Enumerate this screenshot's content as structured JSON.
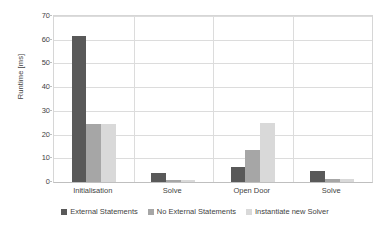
{
  "chart_data": {
    "type": "bar",
    "title": "",
    "subtitle": "",
    "xlabel": "",
    "ylabel": "Runtime [ms]",
    "categories": [
      "Initialisation",
      "Solve",
      "Open Door",
      "Solve"
    ],
    "series": [
      {
        "name": "External Statements",
        "color": "#595959",
        "values": [
          61.5,
          3.9,
          6.3,
          4.8
        ]
      },
      {
        "name": "No External Statements",
        "color": "#a6a6a6",
        "values": [
          24.3,
          0.9,
          13.3,
          1.4
        ]
      },
      {
        "name": "Instantiate new Solver",
        "color": "#d9d9d9",
        "values": [
          24.3,
          1.0,
          24.7,
          1.4
        ]
      }
    ],
    "ylim": [
      0,
      70
    ],
    "yticks": [
      0,
      10,
      20,
      30,
      40,
      50,
      60,
      70
    ],
    "ytick_labels": [
      "0",
      "10",
      "20",
      "30",
      "40",
      "50",
      "60",
      "70"
    ],
    "grid": "horizontal-and-category-separators",
    "legend_position": "bottom",
    "gridline_color": "#dcdcdc",
    "axis_color": "#bfbfbf",
    "text_color": "#3f3f3f",
    "background": "#ffffff"
  }
}
